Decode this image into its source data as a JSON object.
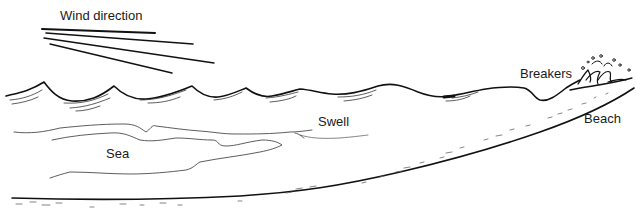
{
  "diagram": {
    "labels": {
      "wind_direction": "Wind direction",
      "swell": "Swell",
      "sea": "Sea",
      "breakers": "Breakers",
      "beach": "Beach"
    },
    "elements": [
      {
        "name": "wind-lines",
        "count": 4,
        "description": "diverging straight lines indicating wind direction"
      },
      {
        "name": "sea-waves",
        "description": "sharp peaked choppy waves on the left"
      },
      {
        "name": "swell-waves",
        "description": "smooth rolling waves in the middle"
      },
      {
        "name": "breaking-wave",
        "description": "wave breaking with spray near beach"
      },
      {
        "name": "sea-floor",
        "description": "curved seabed line rising toward beach"
      }
    ],
    "colors": {
      "ink": "#111111",
      "background": "#ffffff"
    }
  }
}
